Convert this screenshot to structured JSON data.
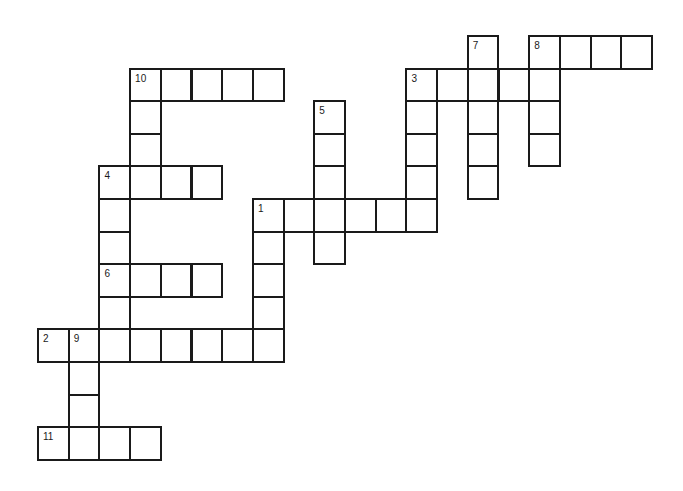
{
  "puzzle": {
    "type": "crossword",
    "grid_origin": {
      "x": 37,
      "y": 35
    },
    "cell_size": {
      "w": 30.7,
      "h": 32.6
    },
    "border_color": "#1a1a1a",
    "cells": [
      {
        "r": 0,
        "c": 14,
        "n": "7"
      },
      {
        "r": 0,
        "c": 16,
        "n": "8"
      },
      {
        "r": 0,
        "c": 17
      },
      {
        "r": 0,
        "c": 18
      },
      {
        "r": 0,
        "c": 19
      },
      {
        "r": 1,
        "c": 3,
        "n": "10"
      },
      {
        "r": 1,
        "c": 4
      },
      {
        "r": 1,
        "c": 5
      },
      {
        "r": 1,
        "c": 6
      },
      {
        "r": 1,
        "c": 7
      },
      {
        "r": 1,
        "c": 12,
        "n": "3"
      },
      {
        "r": 1,
        "c": 13
      },
      {
        "r": 1,
        "c": 14
      },
      {
        "r": 1,
        "c": 15
      },
      {
        "r": 1,
        "c": 16
      },
      {
        "r": 2,
        "c": 3
      },
      {
        "r": 2,
        "c": 9,
        "n": "5"
      },
      {
        "r": 2,
        "c": 12
      },
      {
        "r": 2,
        "c": 14
      },
      {
        "r": 2,
        "c": 16
      },
      {
        "r": 3,
        "c": 3
      },
      {
        "r": 3,
        "c": 9
      },
      {
        "r": 3,
        "c": 12
      },
      {
        "r": 3,
        "c": 14
      },
      {
        "r": 3,
        "c": 16
      },
      {
        "r": 4,
        "c": 2,
        "n": "4"
      },
      {
        "r": 4,
        "c": 3
      },
      {
        "r": 4,
        "c": 4
      },
      {
        "r": 4,
        "c": 5
      },
      {
        "r": 4,
        "c": 9
      },
      {
        "r": 4,
        "c": 12
      },
      {
        "r": 4,
        "c": 14
      },
      {
        "r": 5,
        "c": 2
      },
      {
        "r": 5,
        "c": 7,
        "n": "1"
      },
      {
        "r": 5,
        "c": 8
      },
      {
        "r": 5,
        "c": 9
      },
      {
        "r": 5,
        "c": 10
      },
      {
        "r": 5,
        "c": 11
      },
      {
        "r": 5,
        "c": 12
      },
      {
        "r": 6,
        "c": 2
      },
      {
        "r": 6,
        "c": 7
      },
      {
        "r": 6,
        "c": 9
      },
      {
        "r": 7,
        "c": 2,
        "n": "6"
      },
      {
        "r": 7,
        "c": 3
      },
      {
        "r": 7,
        "c": 4
      },
      {
        "r": 7,
        "c": 5
      },
      {
        "r": 7,
        "c": 7
      },
      {
        "r": 8,
        "c": 2
      },
      {
        "r": 8,
        "c": 7
      },
      {
        "r": 9,
        "c": 0,
        "n": "2"
      },
      {
        "r": 9,
        "c": 1,
        "n": "9"
      },
      {
        "r": 9,
        "c": 2
      },
      {
        "r": 9,
        "c": 3
      },
      {
        "r": 9,
        "c": 4
      },
      {
        "r": 9,
        "c": 5
      },
      {
        "r": 9,
        "c": 6
      },
      {
        "r": 9,
        "c": 7
      },
      {
        "r": 10,
        "c": 1
      },
      {
        "r": 11,
        "c": 1
      },
      {
        "r": 12,
        "c": 0,
        "n": "11"
      },
      {
        "r": 12,
        "c": 1
      },
      {
        "r": 12,
        "c": 2
      },
      {
        "r": 12,
        "c": 3
      }
    ],
    "clues_numbers": [
      "1",
      "2",
      "3",
      "4",
      "5",
      "6",
      "7",
      "8",
      "9",
      "10",
      "11"
    ]
  }
}
